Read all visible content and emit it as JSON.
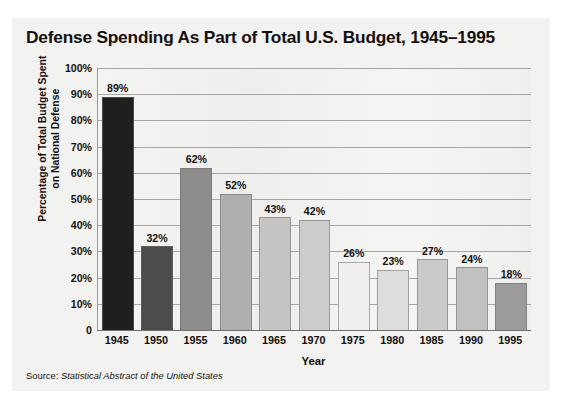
{
  "figure": {
    "title": "Defense Spending As Part of Total U.S. Budget, 1945–1995",
    "source_prefix": "Source: ",
    "source_publication": "Statistical Abstract of the United States",
    "background_color": "#f2f2f1",
    "text_color": "#14100d",
    "gridline_color": "#a6a6a4"
  },
  "chart_data": {
    "type": "bar",
    "title": "Defense Spending As Part of Total U.S. Budget, 1945–1995",
    "xlabel": "Year",
    "ylabel": "Percentage of Total Budget Spent on National Defense",
    "ylabel_line1": "Percentage of Total Budget Spent",
    "ylabel_line2": "on National Defense",
    "categories": [
      "1945",
      "1950",
      "1955",
      "1960",
      "1965",
      "1970",
      "1975",
      "1980",
      "1985",
      "1990",
      "1995"
    ],
    "values": [
      89,
      32,
      62,
      52,
      43,
      42,
      26,
      23,
      27,
      24,
      18
    ],
    "data_labels": [
      "89%",
      "32%",
      "62%",
      "52%",
      "43%",
      "42%",
      "26%",
      "23%",
      "27%",
      "24%",
      "18%"
    ],
    "bar_colors": [
      "#211f1d",
      "#4e4c4a",
      "#8e8d8b",
      "#b0afad",
      "#c6c5c3",
      "#cdcccb",
      "#f0efee",
      "#dedddb",
      "#cbcac8",
      "#c2c1bf",
      "#9d9c9a"
    ],
    "ylim": [
      0,
      100
    ],
    "ytick_values": [
      100,
      90,
      80,
      70,
      60,
      50,
      40,
      30,
      20,
      10,
      0
    ],
    "ytick_labels": [
      "100%",
      "90%",
      "80%",
      "70%",
      "60%",
      "50%",
      "40%",
      "30%",
      "20%",
      "10%",
      "0"
    ],
    "grid": true,
    "grid_axis": "y",
    "legend": false
  }
}
